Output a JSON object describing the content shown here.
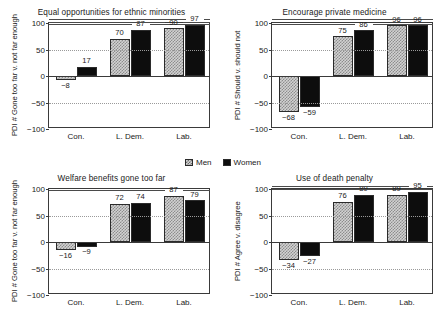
{
  "legend": {
    "entries": [
      {
        "label": "Men",
        "style": "checkered-light-gray",
        "color": "#d2d2d2"
      },
      {
        "label": "Women",
        "style": "solid-black",
        "color": "#0d0d0d"
      }
    ]
  },
  "axis": {
    "yticks": [
      "100",
      "50",
      "0",
      "-50",
      "-100"
    ],
    "ymin": -100,
    "ymax": 100,
    "gridlines": [
      50,
      -50
    ],
    "zeroline": 0
  },
  "chart_data": [
    {
      "type": "bar",
      "title": "Equal opportunities for ethnic minorities",
      "xlabel": "",
      "ylabel": "PDI # Gone too far v. not far enough",
      "categories": [
        "Con.",
        "L. Dem.",
        "Lab."
      ],
      "series": [
        {
          "name": "Men",
          "values": [
            -8,
            70,
            90
          ]
        },
        {
          "name": "Women",
          "values": [
            17,
            87,
            97
          ]
        }
      ],
      "ylim": [
        -100,
        100
      ],
      "grid": true,
      "legend_position": "center-between-rows"
    },
    {
      "type": "bar",
      "title": "Encourage private medicine",
      "xlabel": "",
      "ylabel": "PDI # Should v. should not",
      "categories": [
        "Con.",
        "L. Dem.",
        "Lab."
      ],
      "series": [
        {
          "name": "Men",
          "values": [
            -68,
            75,
            96
          ]
        },
        {
          "name": "Women",
          "values": [
            -59,
            86,
            96
          ]
        }
      ],
      "ylim": [
        -100,
        100
      ],
      "grid": true,
      "legend_position": "center-between-rows"
    },
    {
      "type": "bar",
      "title": "Welfare benefits gone too far",
      "xlabel": "",
      "ylabel": "PDI # Gone too far v. not far enough",
      "categories": [
        "Con.",
        "L. Dem.",
        "Lab."
      ],
      "series": [
        {
          "name": "Men",
          "values": [
            -16,
            72,
            87
          ]
        },
        {
          "name": "Women",
          "values": [
            -9,
            74,
            79
          ]
        }
      ],
      "ylim": [
        -100,
        100
      ],
      "grid": true,
      "legend_position": "center-between-rows"
    },
    {
      "type": "bar",
      "title": "Use of death penalty",
      "xlabel": "",
      "ylabel": "PDI # Agree v. disagree",
      "categories": [
        "Con.",
        "L. Dem.",
        "Lab."
      ],
      "series": [
        {
          "name": "Men",
          "values": [
            -34,
            76,
            89
          ]
        },
        {
          "name": "Women",
          "values": [
            -27,
            89,
            95
          ]
        }
      ],
      "ylim": [
        -100,
        100
      ],
      "grid": true,
      "legend_position": "center-between-rows"
    }
  ]
}
